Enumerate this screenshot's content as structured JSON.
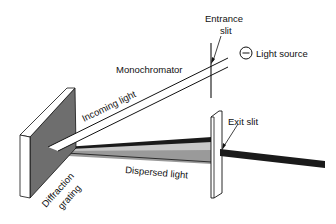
{
  "diagram": {
    "type": "monochromator-schematic",
    "labels": {
      "entrance_slit_line1": "Entrance",
      "entrance_slit_line2": "slit",
      "light_source": "Light source",
      "monochromator": "Monochromator",
      "incoming_light": "Incoming light",
      "exit_slit": "Exit slit",
      "dispersed_light": "Dispersed light",
      "grating_line1": "Diffraction",
      "grating_line2": "grating"
    },
    "components": [
      {
        "name": "light-source",
        "icon": "lamp-circle-icon"
      },
      {
        "name": "entrance-slit"
      },
      {
        "name": "incoming-light-beam"
      },
      {
        "name": "diffraction-grating"
      },
      {
        "name": "dispersed-light-beams"
      },
      {
        "name": "exit-slit"
      },
      {
        "name": "output-beam"
      }
    ],
    "colors": {
      "grating_face": "#6e6e6e",
      "grating_edge": "#ffffff",
      "beam_dark": "#1a1a1a",
      "beam_mid": "#9a9a9a",
      "beam_light": "#c8c8c8",
      "stroke": "#111111"
    }
  }
}
